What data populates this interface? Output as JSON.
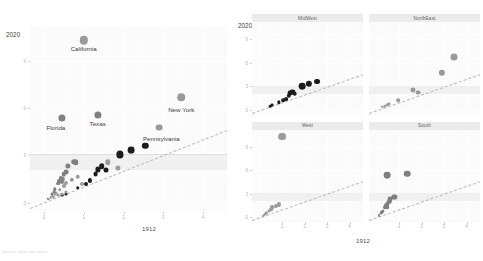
{
  "figure": {
    "y_corner_label": "2020",
    "x_axis_title": "1912",
    "caption": "Source: state vote totals"
  },
  "main_panel": {
    "name": "main-scatter",
    "y_ticks": [
      "9",
      "6",
      "3",
      "0"
    ],
    "x_ticks": [
      "0",
      "1",
      "2",
      "3",
      "4"
    ],
    "x_axis_title": "1912",
    "y_corner_label": "2020",
    "labels": [
      {
        "text": "California",
        "x": 1.0,
        "y": 10.3
      },
      {
        "text": "Florida",
        "x": 0.3,
        "y": 5.3
      },
      {
        "text": "Texas",
        "x": 1.35,
        "y": 5.55
      },
      {
        "text": "New York",
        "x": 3.45,
        "y": 6.45
      },
      {
        "text": "Pennsylvania",
        "x": 2.95,
        "y": 4.6
      }
    ]
  },
  "facets": {
    "y_corner_label": "2020",
    "x_axis_title": "1912",
    "panels": [
      {
        "title": "MidWest",
        "row": 0,
        "col": 0
      },
      {
        "title": "NorthEast",
        "row": 0,
        "col": 1
      },
      {
        "title": "West",
        "row": 1,
        "col": 0
      },
      {
        "title": "South",
        "row": 1,
        "col": 1
      }
    ],
    "x_ticks": [
      "1",
      "2",
      "3",
      "4"
    ],
    "y_ticks": [
      "9",
      "6",
      "3",
      "0"
    ]
  },
  "chart_data": {
    "type": "scatter",
    "title": "",
    "xlabel": "1912",
    "ylabel": "2020",
    "xlim": [
      -0.35,
      4.6
    ],
    "ylim": [
      -0.6,
      11.2
    ],
    "grid": true,
    "legend": false,
    "reference_line": {
      "type": "identity",
      "slope": 1,
      "intercept": 0,
      "style": "dashed",
      "color": "#b9b9b9"
    },
    "highlight_band": {
      "from": 2.05,
      "to": 3.05,
      "color": "#ededed"
    },
    "point_colors": {
      "dark": "#1c1c1c",
      "grey": "#9a9a9a"
    },
    "series": [
      {
        "name": "MidWest",
        "color": "#1c1c1c",
        "points": [
          {
            "label": "Illinois",
            "x": 1.9,
            "y": 3.05,
            "r": 3.6
          },
          {
            "label": "Ohio",
            "x": 2.2,
            "y": 3.35,
            "r": 3.4
          },
          {
            "label": "Michigan",
            "x": 2.55,
            "y": 3.6,
            "r": 3.2
          },
          {
            "label": "Indiana",
            "x": 1.45,
            "y": 2.3,
            "r": 2.8
          },
          {
            "label": "Missouri",
            "x": 1.35,
            "y": 2.1,
            "r": 2.6
          },
          {
            "label": "Wisconsin",
            "x": 1.55,
            "y": 2.05,
            "r": 2.5
          },
          {
            "label": "Minnesota",
            "x": 1.3,
            "y": 1.8,
            "r": 2.4
          },
          {
            "label": "Iowa",
            "x": 1.15,
            "y": 1.4,
            "r": 2.1
          },
          {
            "label": "Kansas",
            "x": 1.05,
            "y": 1.2,
            "r": 2.0
          },
          {
            "label": "Nebraska",
            "x": 0.85,
            "y": 0.95,
            "r": 1.8
          },
          {
            "label": "South Dakota",
            "x": 0.55,
            "y": 0.55,
            "r": 1.5
          },
          {
            "label": "North Dakota",
            "x": 0.45,
            "y": 0.45,
            "r": 1.4
          }
        ]
      },
      {
        "name": "NorthEast",
        "color": "#9a9a9a",
        "points": [
          {
            "label": "New York",
            "x": 3.45,
            "y": 6.7,
            "r": 3.8
          },
          {
            "label": "Pennsylvania",
            "x": 2.9,
            "y": 4.75,
            "r": 3.4
          },
          {
            "label": "Massachusetts",
            "x": 1.6,
            "y": 2.55,
            "r": 2.7
          },
          {
            "label": "New Jersey",
            "x": 1.85,
            "y": 2.2,
            "r": 2.6
          },
          {
            "label": "Connecticut",
            "x": 0.95,
            "y": 1.2,
            "r": 2.0
          },
          {
            "label": "Maine",
            "x": 0.55,
            "y": 0.7,
            "r": 1.6
          },
          {
            "label": "Rhode Island",
            "x": 0.45,
            "y": 0.55,
            "r": 1.5
          },
          {
            "label": "New Hampshire",
            "x": 0.35,
            "y": 0.45,
            "r": 1.4
          },
          {
            "label": "Vermont",
            "x": 0.25,
            "y": 0.35,
            "r": 1.3
          }
        ]
      },
      {
        "name": "West",
        "color": "#9a9a9a",
        "points": [
          {
            "label": "California",
            "x": 1.0,
            "y": 10.3,
            "r": 4.2
          },
          {
            "label": "Washington",
            "x": 0.85,
            "y": 1.65,
            "r": 2.3
          },
          {
            "label": "Colorado",
            "x": 0.7,
            "y": 1.45,
            "r": 2.2
          },
          {
            "label": "Arizona",
            "x": 0.55,
            "y": 1.25,
            "r": 2.1
          },
          {
            "label": "Oregon",
            "x": 0.5,
            "y": 1.05,
            "r": 2.0
          },
          {
            "label": "Utah",
            "x": 0.4,
            "y": 0.8,
            "r": 1.7
          },
          {
            "label": "Nevada",
            "x": 0.3,
            "y": 0.6,
            "r": 1.5
          },
          {
            "label": "New Mexico",
            "x": 0.28,
            "y": 0.5,
            "r": 1.4
          },
          {
            "label": "Idaho",
            "x": 0.22,
            "y": 0.4,
            "r": 1.3
          },
          {
            "label": "Montana",
            "x": 0.18,
            "y": 0.32,
            "r": 1.2
          },
          {
            "label": "Wyoming",
            "x": 0.12,
            "y": 0.22,
            "r": 1.1
          }
        ]
      },
      {
        "name": "South",
        "color": "#7f7f7f",
        "points": [
          {
            "label": "Texas",
            "x": 1.35,
            "y": 5.55,
            "r": 3.6
          },
          {
            "label": "Florida",
            "x": 0.45,
            "y": 5.35,
            "r": 3.6
          },
          {
            "label": "Georgia",
            "x": 0.75,
            "y": 2.6,
            "r": 2.8
          },
          {
            "label": "North Carolina",
            "x": 0.8,
            "y": 2.55,
            "r": 2.8
          },
          {
            "label": "Virginia",
            "x": 0.6,
            "y": 2.35,
            "r": 2.6
          },
          {
            "label": "Tennessee",
            "x": 0.55,
            "y": 1.95,
            "r": 2.4
          },
          {
            "label": "Maryland",
            "x": 0.5,
            "y": 1.8,
            "r": 2.3
          },
          {
            "label": "South Carolina",
            "x": 0.42,
            "y": 1.55,
            "r": 2.1
          },
          {
            "label": "Alabama",
            "x": 0.48,
            "y": 1.5,
            "r": 2.1
          },
          {
            "label": "Louisiana",
            "x": 0.38,
            "y": 1.35,
            "r": 2.0
          },
          {
            "label": "Kentucky",
            "x": 0.45,
            "y": 1.3,
            "r": 2.0
          },
          {
            "label": "Oklahoma",
            "x": 0.35,
            "y": 1.2,
            "r": 1.9
          },
          {
            "label": "Arkansas",
            "x": 0.28,
            "y": 0.85,
            "r": 1.7
          },
          {
            "label": "Mississippi",
            "x": 0.25,
            "y": 0.7,
            "r": 1.6
          },
          {
            "label": "West Virginia",
            "x": 0.2,
            "y": 0.55,
            "r": 1.5
          },
          {
            "label": "Delaware",
            "x": 0.1,
            "y": 0.25,
            "r": 1.2
          }
        ]
      }
    ]
  }
}
